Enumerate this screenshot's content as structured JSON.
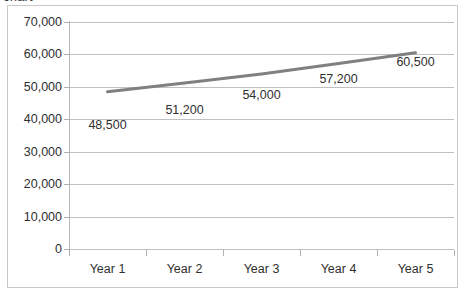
{
  "clipped_header_text": "chart",
  "chart_data": {
    "type": "line",
    "title": "",
    "subtitle": "",
    "xlabel": "",
    "ylabel": "",
    "categories": [
      "Year 1",
      "Year 2",
      "Year 3",
      "Year 4",
      "Year 5"
    ],
    "values": [
      48500,
      51200,
      54000,
      57200,
      60500
    ],
    "point_labels": [
      "48,500",
      "51,200",
      "54,000",
      "57,200",
      "60,500"
    ],
    "series": [
      {
        "name": "Series 1",
        "values": [
          48500,
          51200,
          54000,
          57200,
          60500
        ],
        "color": "#808080",
        "line_width": 3
      }
    ],
    "ylim": [
      0,
      70000
    ],
    "y_tick_step": 10000,
    "y_tick_values": [
      0,
      10000,
      20000,
      30000,
      40000,
      50000,
      60000,
      70000
    ],
    "y_tick_labels": [
      "0",
      "10,000",
      "20,000",
      "30,000",
      "40,000",
      "50,000",
      "60,000",
      "70,000"
    ],
    "grid": true,
    "grid_axis": "y",
    "grid_color": "#c0c0c0",
    "legend": false,
    "legend_position": "none",
    "markers": false,
    "plot_background": "#ffffff",
    "border_color": "#c8c8c8",
    "axis_color": "#b9b9b9",
    "text_color": "#2f2f2f"
  }
}
